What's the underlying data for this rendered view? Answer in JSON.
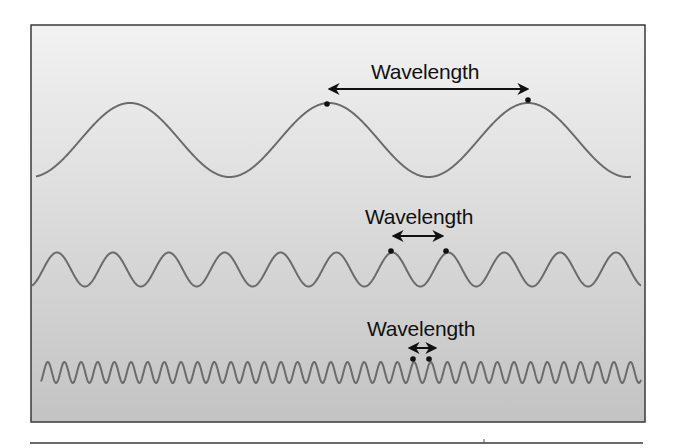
{
  "figure": {
    "width": 676,
    "height": 448,
    "frame": {
      "x": 31,
      "y": 25,
      "width": 614,
      "height": 397,
      "border_color": "#3a3a3a"
    },
    "background": {
      "top_color": "#f2f2f2",
      "bottom_color": "#c3c3c3"
    },
    "bottom_rule": {
      "x1": 30,
      "x2": 643,
      "y": 443,
      "color": "#3a3a3a",
      "tick_x": 484
    },
    "wave_color": "#6b6b6b",
    "marker_color": "#111111",
    "arrow_color": "#111111"
  },
  "waves": [
    {
      "id": "long",
      "label": "Wavelength",
      "label_pos": {
        "x": 371,
        "y": 61
      },
      "x_start": 36,
      "x_end": 631,
      "center_y": 140,
      "amplitude": 37,
      "period": 199,
      "first_peak_x": 130,
      "arrow": {
        "x1": 330,
        "x2": 527,
        "y": 89
      },
      "markers": [
        {
          "x": 327,
          "y": 104
        },
        {
          "x": 528,
          "y": 100
        }
      ]
    },
    {
      "id": "medium",
      "label": "Wavelength",
      "label_pos": {
        "x": 365,
        "y": 206
      },
      "x_start": 32,
      "x_end": 641,
      "center_y": 269.5,
      "amplitude": 17,
      "period": 55.9,
      "first_peak_x": 57,
      "arrow": {
        "x1": 394,
        "x2": 442,
        "y": 236
      },
      "markers": [
        {
          "x": 391,
          "y": 251
        },
        {
          "x": 446,
          "y": 251
        }
      ]
    },
    {
      "id": "short",
      "label": "Wavelength",
      "label_pos": {
        "x": 367,
        "y": 318
      },
      "x_start": 41,
      "x_end": 641,
      "center_y": 372.5,
      "amplitude": 10.5,
      "period": 16.65,
      "first_peak_x": 47.8,
      "arrow": {
        "x1": 410,
        "x2": 435,
        "y": 348
      },
      "markers": [
        {
          "x": 413,
          "y": 359
        },
        {
          "x": 429,
          "y": 359
        }
      ]
    }
  ]
}
